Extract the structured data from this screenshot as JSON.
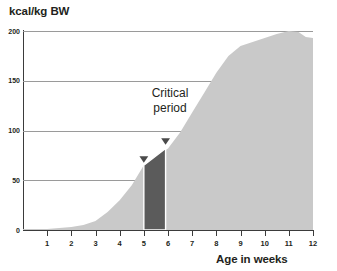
{
  "chart_data": {
    "type": "area",
    "title": "",
    "ylabel": "kcal/kg BW",
    "xlabel": "Age in weeks",
    "xlim": [
      0,
      12
    ],
    "ylim": [
      0,
      200
    ],
    "grid": true,
    "legend": null,
    "y_ticks": [
      0,
      50,
      100,
      150,
      200
    ],
    "y_tick_labels": [
      "0",
      "50",
      "100",
      "150",
      "200"
    ],
    "x_ticks": [
      1,
      2,
      3,
      4,
      5,
      6,
      7,
      8,
      9,
      10,
      11,
      12
    ],
    "x_tick_labels": [
      "1",
      "2",
      "3",
      "4",
      "5",
      "6",
      "7",
      "8",
      "9",
      "10",
      "11",
      "12"
    ],
    "series": [
      {
        "name": "energy-requirement",
        "fill_color": "#c9c9c9",
        "x": [
          0,
          0.5,
          1,
          1.5,
          2,
          2.5,
          3,
          3.5,
          4,
          4.5,
          5,
          5.5,
          6,
          6.5,
          7,
          7.5,
          8,
          8.5,
          9,
          9.5,
          10,
          10.5,
          11,
          11.4,
          11.7,
          12
        ],
        "values": [
          1,
          1,
          1,
          2,
          3,
          5,
          9,
          18,
          30,
          45,
          65,
          74,
          82,
          98,
          118,
          138,
          158,
          175,
          185,
          189,
          193,
          197,
          200,
          199,
          194,
          193
        ]
      }
    ],
    "highlight_bar": {
      "name": "critical-period-bar",
      "x_start": 5,
      "x_end": 5.9,
      "y_bottom": 0,
      "y_top_left": 65,
      "y_top_right": 82,
      "color": "#5b5b5b"
    },
    "markers": [
      {
        "name": "marker-left",
        "shape": "triangle-down",
        "x": 5.0,
        "y": 70,
        "color": "#4a4a4a"
      },
      {
        "name": "marker-right",
        "shape": "triangle-down",
        "x": 5.9,
        "y": 88,
        "color": "#4a4a4a"
      }
    ],
    "annotations": [
      {
        "name": "critical-period",
        "line1": "Critical",
        "line2": "period"
      }
    ],
    "colors": {
      "area_fill": "#c9c9c9",
      "bar_fill": "#5b5b5b",
      "axis": "#3b3b3b",
      "gridline": "#9a9a9a",
      "text": "#231f20",
      "background": "#ffffff"
    }
  }
}
